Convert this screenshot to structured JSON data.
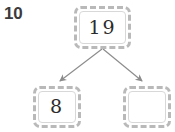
{
  "worksheet": {
    "question_number": "10",
    "type": "number-bond",
    "background_color": "#ffffff",
    "box_border_color": "#b9b9b9",
    "text_color": "#2b2b2b",
    "arrow_color": "#8c8c8c"
  },
  "number_bond": {
    "whole": {
      "label": "19",
      "filled": true
    },
    "parts": [
      {
        "label": "8",
        "filled": true
      },
      {
        "label": "",
        "filled": false
      }
    ]
  }
}
